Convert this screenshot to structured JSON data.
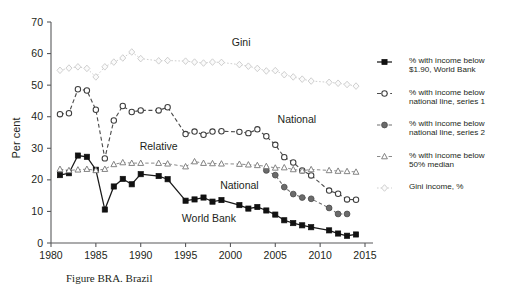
{
  "figure": {
    "caption": "Figure BRA. Brazil"
  },
  "axes": {
    "ylabel": "Per cent",
    "xlabel": "",
    "yticks": [
      "0",
      "10",
      "20",
      "30",
      "40",
      "50",
      "60",
      "70"
    ],
    "xticks": [
      "1980",
      "1985",
      "1990",
      "1995",
      "2000",
      "2005",
      "2010",
      "2015"
    ],
    "ylim": [
      0,
      70
    ],
    "xlim": [
      1980,
      2015
    ],
    "grid": false
  },
  "annotations": [
    {
      "text": "Gini",
      "x": 2001.2,
      "y": 62.5
    },
    {
      "text": "National",
      "x": 2007.4,
      "y": 38.0
    },
    {
      "text": "Relative",
      "x": 1992.0,
      "y": 29.6
    },
    {
      "text": "National",
      "x": 2001.0,
      "y": 17.2
    },
    {
      "text": "World Bank",
      "x": 1997.6,
      "y": 6.6
    }
  ],
  "legend": {
    "position": "right",
    "items": [
      {
        "label": "% with income below\n$1.90, World Bank",
        "line1": "% with income below",
        "line2": "$1.90, World Bank",
        "marker": "filled-square-marker",
        "color": "#111111",
        "line_style": "solid"
      },
      {
        "label": "% with income below\nnational line, series 1",
        "line1": "% with income below",
        "line2": "national line, series 1",
        "marker": "open-circle-marker",
        "color": "#3d3d3d",
        "line_style": "dashed"
      },
      {
        "label": "% with income below\nnational line, series 2",
        "line1": "% with income below",
        "line2": "national line, series 2",
        "marker": "filled-circle-marker",
        "color": "#6b6b6b",
        "line_style": "dashed"
      },
      {
        "label": "% with income below\n50% median",
        "line1": "% with income below",
        "line2": "50% median",
        "marker": "open-triangle-marker",
        "color": "#7d7d7d",
        "line_style": "dashed"
      },
      {
        "label": "Gini income, %",
        "line1": "Gini income, %",
        "line2": "",
        "marker": "open-diamond-marker",
        "color": "#c9c9c9",
        "line_style": "dotted"
      }
    ]
  },
  "chart_data": {
    "type": "line",
    "title": "Figure BRA. Brazil",
    "xlabel": "",
    "ylabel": "Per cent",
    "xlim": [
      1980,
      2015
    ],
    "ylim": [
      0,
      70
    ],
    "grid": false,
    "legend_position": "right",
    "series": [
      {
        "name": "% with income below $1.90, World Bank",
        "short_name": "World Bank",
        "marker": "filled-square-marker",
        "color": "#111111",
        "line_style": "solid",
        "x": [
          1981,
          1982,
          1983,
          1984,
          1985,
          1986,
          1987,
          1988,
          1989,
          1990,
          1992,
          1993,
          1995,
          1996,
          1997,
          1998,
          1999,
          2001,
          2002,
          2003,
          2004,
          2005,
          2006,
          2007,
          2008,
          2009,
          2011,
          2012,
          2013,
          2014
        ],
        "y": [
          21.5,
          22.1,
          27.7,
          27.3,
          23.2,
          10.6,
          17.9,
          20.3,
          18.6,
          21.8,
          21.2,
          20.2,
          13.4,
          13.8,
          14.4,
          13.1,
          13.6,
          12.0,
          10.9,
          11.4,
          10.3,
          9.0,
          7.2,
          6.3,
          5.6,
          5.0,
          4.0,
          3.0,
          2.3,
          2.7
        ]
      },
      {
        "name": "% with income below national line, series 1",
        "short_name": "National",
        "marker": "open-circle-marker",
        "color": "#3d3d3d",
        "line_style": "dashed",
        "x": [
          1981,
          1982,
          1983,
          1984,
          1985,
          1986,
          1987,
          1988,
          1989,
          1990,
          1992,
          1993,
          1995,
          1996,
          1997,
          1998,
          1999,
          2001,
          2002,
          2003,
          2004,
          2005,
          2006,
          2007,
          2008,
          2009,
          2011,
          2012,
          2013,
          2014
        ],
        "y": [
          40.8,
          41.1,
          48.7,
          48.3,
          42.2,
          26.8,
          38.8,
          43.4,
          41.5,
          42.0,
          42.0,
          43.0,
          34.5,
          35.3,
          34.3,
          35.3,
          35.4,
          35.2,
          34.8,
          36.0,
          33.8,
          31.1,
          27.2,
          25.5,
          23.0,
          21.4,
          16.6,
          15.6,
          13.8,
          13.7
        ]
      },
      {
        "name": "% with income below national line, series 2",
        "short_name": "National",
        "marker": "filled-circle-marker",
        "color": "#6b6b6b",
        "line_style": "dashed",
        "x": [
          2004,
          2005,
          2006,
          2007,
          2008,
          2009,
          2011,
          2012,
          2013
        ],
        "y": [
          23.0,
          21.5,
          17.7,
          15.5,
          14.4,
          14.0,
          11.1,
          9.2,
          9.2
        ]
      },
      {
        "name": "% with income below 50% median",
        "short_name": "Relative",
        "marker": "open-triangle-marker",
        "color": "#7d7d7d",
        "line_style": "dashed",
        "x": [
          1981,
          1982,
          1983,
          1984,
          1985,
          1986,
          1987,
          1988,
          1989,
          1990,
          1992,
          1993,
          1995,
          1996,
          1997,
          1998,
          1999,
          2001,
          2002,
          2003,
          2004,
          2005,
          2006,
          2007,
          2008,
          2009,
          2011,
          2012,
          2013,
          2014
        ],
        "y": [
          23.4,
          23.0,
          23.2,
          23.4,
          23.0,
          23.4,
          24.9,
          25.5,
          25.3,
          25.3,
          25.3,
          25.1,
          24.2,
          25.8,
          25.3,
          25.2,
          25.1,
          25.0,
          24.8,
          24.6,
          24.3,
          23.8,
          23.9,
          23.3,
          22.9,
          23.3,
          23.0,
          22.8,
          22.7,
          22.5
        ]
      },
      {
        "name": "Gini income, %",
        "short_name": "Gini",
        "marker": "open-diamond-marker",
        "color": "#c9c9c9",
        "line_style": "dotted",
        "x": [
          1981,
          1982,
          1983,
          1984,
          1985,
          1986,
          1987,
          1988,
          1989,
          1990,
          1992,
          1993,
          1995,
          1996,
          1997,
          1998,
          1999,
          2001,
          2002,
          2003,
          2004,
          2005,
          2006,
          2007,
          2008,
          2009,
          2011,
          2012,
          2013,
          2014
        ],
        "y": [
          54.7,
          55.4,
          55.8,
          55.3,
          52.6,
          55.8,
          57.3,
          58.6,
          60.5,
          58.4,
          57.7,
          57.8,
          57.6,
          57.3,
          57.0,
          57.3,
          57.2,
          56.5,
          56.0,
          55.3,
          54.5,
          54.6,
          53.3,
          52.6,
          51.9,
          51.3,
          50.9,
          50.6,
          50.2,
          49.7
        ]
      }
    ]
  }
}
